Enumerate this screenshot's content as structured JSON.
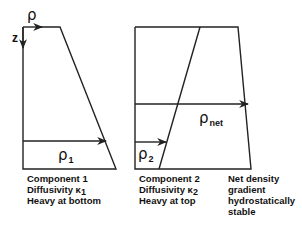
{
  "axes": {
    "horizontal_label": "ρ",
    "vertical_label": "z"
  },
  "panels": [
    {
      "id": "component-1",
      "arrow_symbol": "ρ",
      "arrow_subscript": "1",
      "caption": [
        "Component 1",
        "Diffusivity κ",
        "Heavy at bottom"
      ],
      "caption_subscript": "1"
    },
    {
      "id": "component-2",
      "arrow_symbol": "ρ",
      "arrow_subscript": "2",
      "caption": [
        "Component 2",
        "Diffusivity κ",
        "Heavy at top"
      ],
      "caption_subscript": "2"
    },
    {
      "id": "net",
      "arrow_symbol": "ρ",
      "arrow_subscript": "net",
      "caption": [
        "Net density",
        "gradient",
        "hydrostatically",
        "stable"
      ]
    }
  ]
}
